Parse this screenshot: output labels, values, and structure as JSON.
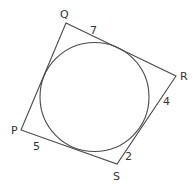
{
  "diagram": {
    "vertices": [
      {
        "name": "P",
        "x": 21,
        "y": 130,
        "label_x": 11,
        "label_y": 134
      },
      {
        "name": "Q",
        "x": 66,
        "y": 23,
        "label_x": 60,
        "label_y": 18
      },
      {
        "name": "R",
        "x": 176,
        "y": 76,
        "label_x": 180,
        "label_y": 80
      },
      {
        "name": "S",
        "x": 117,
        "y": 164,
        "label_x": 113,
        "label_y": 180
      }
    ],
    "circle": {
      "cx": 94.5,
      "cy": 97,
      "r": 54.5
    },
    "segment_labels": [
      {
        "text": "7",
        "side": "QR",
        "x": 90,
        "y": 34
      },
      {
        "text": "4",
        "side": "RS",
        "x": 163,
        "y": 105
      },
      {
        "text": "2",
        "side": "RS",
        "x": 125,
        "y": 160
      },
      {
        "text": "5",
        "side": "PS",
        "x": 33,
        "y": 150
      }
    ],
    "colors": {
      "stroke": "#4a4a4a",
      "text": "#333333",
      "background": "#ffffff"
    }
  }
}
